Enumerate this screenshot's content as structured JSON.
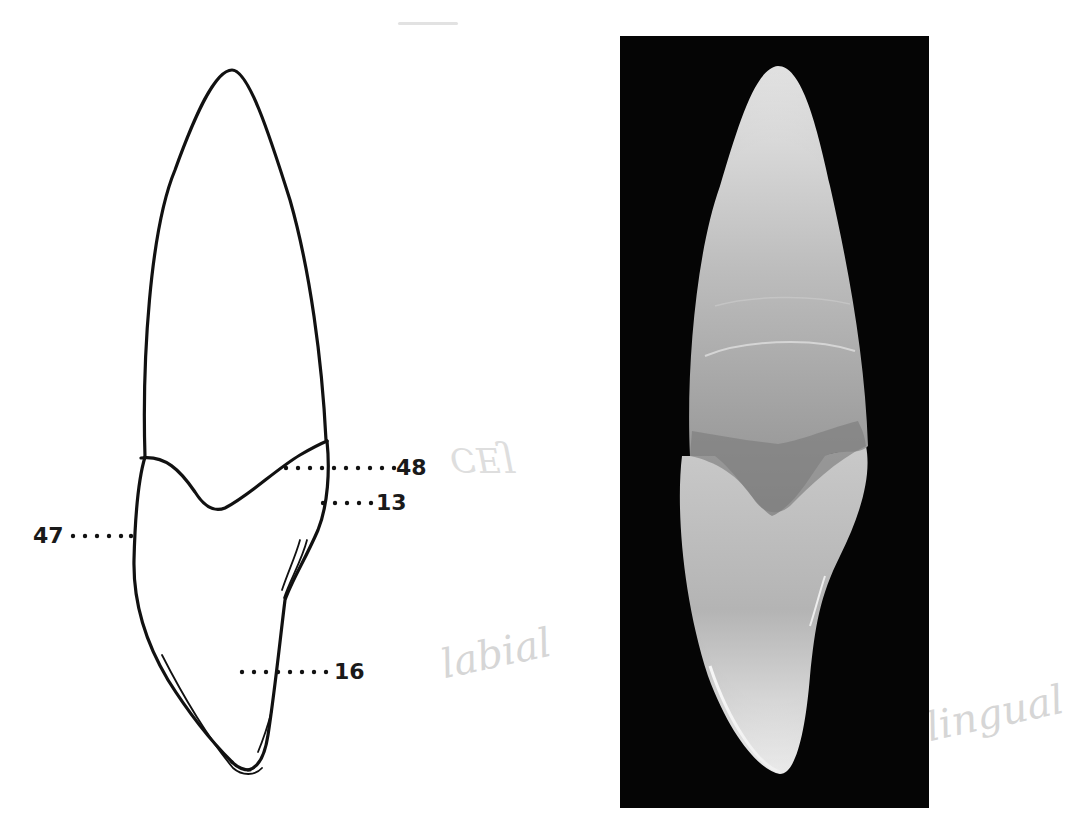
{
  "figure": {
    "drawing": {
      "labels": [
        {
          "id": "48",
          "text": "48"
        },
        {
          "id": "13",
          "text": "13"
        },
        {
          "id": "47",
          "text": "47"
        },
        {
          "id": "16",
          "text": "16"
        }
      ]
    },
    "photo": {
      "description": "photograph of tooth on black background"
    },
    "annotations": {
      "pencil_1": "CEJ",
      "pencil_2": "labial",
      "pencil_3": "lingual"
    }
  }
}
